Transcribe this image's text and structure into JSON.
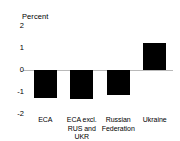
{
  "chart_data": {
    "type": "bar",
    "title": "",
    "subtitle": "",
    "unit_label": "Percent",
    "xlabel": "",
    "ylabel": "Percent",
    "ylim": [
      -2,
      2
    ],
    "yticks": [
      2,
      1,
      0,
      -1,
      -2
    ],
    "ytick_labels": [
      "2",
      "1",
      "0",
      "-1",
      "-2"
    ],
    "grid": false,
    "legend": null,
    "zero_line": true,
    "bar_color": "#000000",
    "axis_color": "#b9b9b9",
    "text_color": "#000000",
    "background": "#ffffff",
    "categories": [
      "ECA",
      "ECA excl. RUS and UKR",
      "Russian Federation",
      "Ukraine"
    ],
    "values": [
      -1.25,
      -1.3,
      -1.15,
      1.25
    ],
    "series": [
      {
        "name": "Percent",
        "values": [
          -1.25,
          -1.3,
          -1.15,
          1.25
        ]
      }
    ]
  }
}
